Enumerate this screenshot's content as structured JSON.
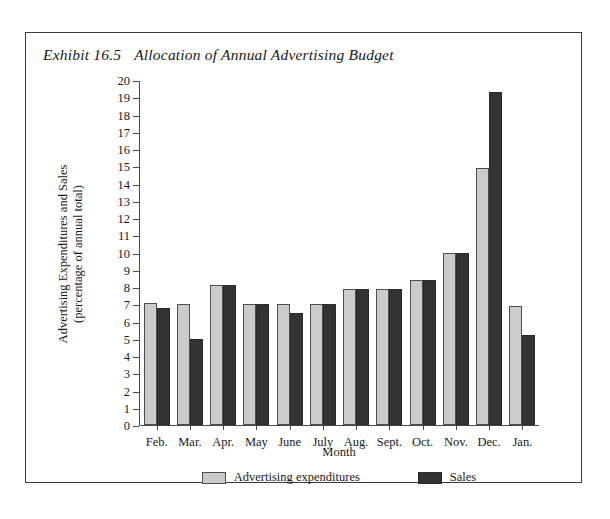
{
  "figure": {
    "exhibit_number": "Exhibit 16.5",
    "title": "Allocation of Annual Advertising Budget"
  },
  "chart_data": {
    "type": "bar",
    "title": "Allocation of Annual Advertising Budget",
    "xlabel": "Month",
    "ylabel": "Advertising Expenditures and Sales (percentage of annual total)",
    "ylabel_line1": "Advertising Expenditures and Sales",
    "ylabel_line2": "(percentage of annual total)",
    "categories": [
      "Feb.",
      "Mar.",
      "Apr.",
      "May",
      "June",
      "July",
      "Aug.",
      "Sept.",
      "Oct.",
      "Nov.",
      "Dec.",
      "Jan."
    ],
    "series": [
      {
        "name": "Advertising expenditures",
        "color": "#cbcbcb",
        "values": [
          7.1,
          7.0,
          8.1,
          7.0,
          7.0,
          7.0,
          7.9,
          7.9,
          8.4,
          10.0,
          14.9,
          6.9
        ]
      },
      {
        "name": "Sales",
        "color": "#333333",
        "values": [
          6.8,
          5.0,
          8.1,
          7.0,
          6.5,
          7.0,
          7.9,
          7.9,
          8.4,
          10.0,
          19.3,
          5.2
        ]
      }
    ],
    "ylim": [
      0,
      20
    ],
    "ytick_step": 1,
    "yticks": [
      20,
      19,
      18,
      17,
      16,
      15,
      14,
      13,
      12,
      11,
      10,
      9,
      8,
      7,
      6,
      5,
      4,
      3,
      2,
      1,
      0
    ],
    "grid": false,
    "legend_position": "bottom"
  },
  "legend": {
    "items": [
      {
        "label": "Advertising expenditures"
      },
      {
        "label": "Sales"
      }
    ]
  }
}
